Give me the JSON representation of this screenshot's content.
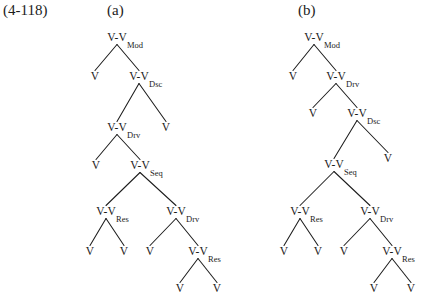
{
  "figure": {
    "equation_number": "(4-118)",
    "panels": [
      {
        "id": "a",
        "label": "(a)"
      },
      {
        "id": "b",
        "label": "(b)"
      }
    ]
  },
  "node_text": {
    "branching": "V-V",
    "leaf": "V"
  },
  "relation_labels": {
    "mod": "Mod",
    "dsc": "Dsc",
    "drv": "Drv",
    "seq": "Seq",
    "res": "Res"
  },
  "tree_a": {
    "panel": "(a)",
    "nodes": [
      {
        "id": "a0",
        "text": "V-V",
        "rel": "Mod",
        "x": 117,
        "y": 41
      },
      {
        "id": "a1",
        "text": "V",
        "rel": "",
        "x": 95,
        "y": 80
      },
      {
        "id": "a2",
        "text": "V-V",
        "rel": "Dsc",
        "x": 139,
        "y": 80
      },
      {
        "id": "a3",
        "text": "V-V",
        "rel": "Drv",
        "x": 117,
        "y": 131
      },
      {
        "id": "a4",
        "text": "V",
        "rel": "",
        "x": 166,
        "y": 131
      },
      {
        "id": "a5",
        "text": "V",
        "rel": "",
        "x": 96,
        "y": 169
      },
      {
        "id": "a6",
        "text": "V-V",
        "rel": "Seq",
        "x": 140,
        "y": 169
      },
      {
        "id": "a7",
        "text": "V-V",
        "rel": "Res",
        "x": 106,
        "y": 215
      },
      {
        "id": "a8",
        "text": "V-V",
        "rel": "Drv",
        "x": 176,
        "y": 215
      },
      {
        "id": "a9",
        "text": "V",
        "rel": "",
        "x": 90,
        "y": 255
      },
      {
        "id": "a10",
        "text": "V",
        "rel": "",
        "x": 124,
        "y": 255
      },
      {
        "id": "a11",
        "text": "V",
        "rel": "",
        "x": 150,
        "y": 255
      },
      {
        "id": "a12",
        "text": "V-V",
        "rel": "Res",
        "x": 198,
        "y": 255
      },
      {
        "id": "a13",
        "text": "V",
        "rel": "",
        "x": 180,
        "y": 292
      },
      {
        "id": "a14",
        "text": "V",
        "rel": "",
        "x": 217,
        "y": 292
      }
    ],
    "edges": [
      [
        "a0",
        "a1"
      ],
      [
        "a0",
        "a2"
      ],
      [
        "a2",
        "a3"
      ],
      [
        "a2",
        "a4"
      ],
      [
        "a3",
        "a5"
      ],
      [
        "a3",
        "a6"
      ],
      [
        "a6",
        "a7"
      ],
      [
        "a6",
        "a8"
      ],
      [
        "a7",
        "a9"
      ],
      [
        "a7",
        "a10"
      ],
      [
        "a8",
        "a11"
      ],
      [
        "a8",
        "a12"
      ],
      [
        "a12",
        "a13"
      ],
      [
        "a12",
        "a14"
      ]
    ]
  },
  "tree_b": {
    "panel": "(b)",
    "nodes": [
      {
        "id": "b0",
        "text": "V-V",
        "rel": "Mod",
        "x": 314,
        "y": 41
      },
      {
        "id": "b1",
        "text": "V",
        "rel": "",
        "x": 293,
        "y": 80
      },
      {
        "id": "b2",
        "text": "V-V",
        "rel": "Drv",
        "x": 336,
        "y": 80
      },
      {
        "id": "b3",
        "text": "V",
        "rel": "",
        "x": 313,
        "y": 117
      },
      {
        "id": "b4",
        "text": "V-V",
        "rel": "Dsc",
        "x": 357,
        "y": 117
      },
      {
        "id": "b5",
        "text": "V-V",
        "rel": "Seq",
        "x": 334,
        "y": 168
      },
      {
        "id": "b6",
        "text": "V",
        "rel": "",
        "x": 388,
        "y": 162
      },
      {
        "id": "b7",
        "text": "V-V",
        "rel": "Res",
        "x": 300,
        "y": 215
      },
      {
        "id": "b8",
        "text": "V-V",
        "rel": "Drv",
        "x": 370,
        "y": 215
      },
      {
        "id": "b9",
        "text": "V",
        "rel": "",
        "x": 284,
        "y": 255
      },
      {
        "id": "b10",
        "text": "V",
        "rel": "",
        "x": 318,
        "y": 255
      },
      {
        "id": "b11",
        "text": "V",
        "rel": "",
        "x": 344,
        "y": 255
      },
      {
        "id": "b12",
        "text": "V-V",
        "rel": "Res",
        "x": 392,
        "y": 255
      },
      {
        "id": "b13",
        "text": "V",
        "rel": "",
        "x": 374,
        "y": 292
      },
      {
        "id": "b14",
        "text": "V",
        "rel": "",
        "x": 411,
        "y": 292
      }
    ],
    "edges": [
      [
        "b0",
        "b1"
      ],
      [
        "b0",
        "b2"
      ],
      [
        "b2",
        "b3"
      ],
      [
        "b2",
        "b4"
      ],
      [
        "b4",
        "b5"
      ],
      [
        "b4",
        "b6"
      ],
      [
        "b5",
        "b7"
      ],
      [
        "b5",
        "b8"
      ],
      [
        "b7",
        "b9"
      ],
      [
        "b7",
        "b10"
      ],
      [
        "b8",
        "b11"
      ],
      [
        "b8",
        "b12"
      ],
      [
        "b12",
        "b13"
      ],
      [
        "b12",
        "b14"
      ]
    ]
  }
}
